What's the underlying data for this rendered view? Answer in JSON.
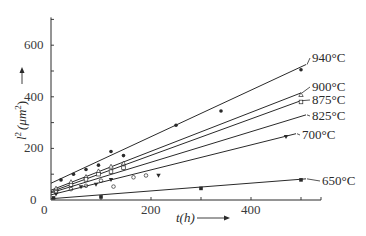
{
  "chart_data": {
    "type": "scatter",
    "title": "",
    "xlabel": "t(h)",
    "ylabel": "l² (μm²)",
    "xlim": [
      0,
      540
    ],
    "ylim": [
      0,
      700
    ],
    "x_ticks": [
      0,
      200,
      400
    ],
    "x_minor_ticks": [
      100,
      300,
      500
    ],
    "y_ticks": [
      0,
      200,
      400,
      600
    ],
    "y_minor_ticks": [
      100,
      300,
      500,
      700
    ],
    "grid": false,
    "legend": "inline labels at line ends (right)",
    "series": [
      {
        "name": "940°C",
        "marker": "filled-circle",
        "fit": {
          "x0": 0,
          "y0": 65,
          "x1": 510,
          "y1": 525
        },
        "points": [
          [
            20,
            78
          ],
          [
            45,
            100
          ],
          [
            70,
            118
          ],
          [
            95,
            135
          ],
          [
            120,
            188
          ],
          [
            145,
            172
          ],
          [
            250,
            290
          ],
          [
            340,
            345
          ],
          [
            500,
            505
          ]
        ]
      },
      {
        "name": "900°C",
        "marker": "open-triangle",
        "fit": {
          "x0": 0,
          "y0": 38,
          "x1": 500,
          "y1": 415
        },
        "points": [
          [
            10,
            45
          ],
          [
            40,
            70
          ],
          [
            70,
            90
          ],
          [
            95,
            112
          ],
          [
            120,
            130
          ],
          [
            145,
            142
          ],
          [
            500,
            408
          ]
        ]
      },
      {
        "name": "875°C",
        "marker": "open-square",
        "fit": {
          "x0": 0,
          "y0": 32,
          "x1": 500,
          "y1": 385
        },
        "points": [
          [
            10,
            35
          ],
          [
            40,
            58
          ],
          [
            70,
            80
          ],
          [
            95,
            100
          ],
          [
            120,
            110
          ],
          [
            145,
            125
          ],
          [
            500,
            380
          ]
        ]
      },
      {
        "name": "825°C",
        "marker": "open-circle",
        "fit": {
          "x0": 0,
          "y0": 28,
          "x1": 510,
          "y1": 330
        },
        "points": [
          [
            10,
            30
          ],
          [
            40,
            42
          ],
          [
            70,
            55
          ],
          [
            100,
            75
          ],
          [
            125,
            52
          ],
          [
            165,
            88
          ],
          [
            190,
            95
          ]
        ]
      },
      {
        "name": "700°C",
        "marker": "filled-inverted-triangle",
        "fit": {
          "x0": 0,
          "y0": 20,
          "x1": 490,
          "y1": 257
        },
        "points": [
          [
            10,
            22
          ],
          [
            60,
            50
          ],
          [
            90,
            60
          ],
          [
            120,
            78
          ],
          [
            215,
            95
          ],
          [
            470,
            245
          ]
        ]
      },
      {
        "name": "650°C",
        "marker": "filled-square",
        "fit": {
          "x0": 0,
          "y0": 5,
          "x1": 510,
          "y1": 82
        },
        "points": [
          [
            5,
            8
          ],
          [
            100,
            12
          ],
          [
            300,
            45
          ],
          [
            500,
            78
          ]
        ]
      }
    ]
  },
  "axes": {
    "x_title": "t(h)",
    "y_title_main": "l",
    "y_title_sup": "2",
    "y_title_unit": "(μm",
    "y_title_unit_sup": "2",
    "y_title_close": ")",
    "x_tick_labels": [
      "0",
      "200",
      "400"
    ],
    "y_tick_labels": [
      "0",
      "200",
      "400",
      "600"
    ]
  },
  "colors": {
    "ink": "#2a2a2a",
    "background": "#ffffff"
  }
}
